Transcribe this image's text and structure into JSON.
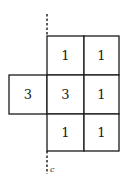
{
  "diagram": {
    "rows": [
      {
        "cells": [
          null,
          "1",
          "1"
        ]
      },
      {
        "cells": [
          "3",
          "3",
          "1"
        ]
      },
      {
        "cells": [
          null,
          "1",
          "1"
        ]
      }
    ],
    "axis_label": "c"
  }
}
